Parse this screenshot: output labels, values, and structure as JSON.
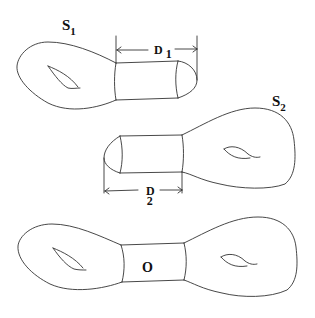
{
  "figure": {
    "surfaces": [
      {
        "id": "S1",
        "label_main": "S",
        "label_sub": "1",
        "dimension_main": "D",
        "dimension_sub": "1"
      },
      {
        "id": "S2",
        "label_main": "S",
        "label_sub": "2",
        "dimension_main": "D",
        "dimension_sub": "2"
      }
    ],
    "result": {
      "neck_label": "O"
    }
  }
}
